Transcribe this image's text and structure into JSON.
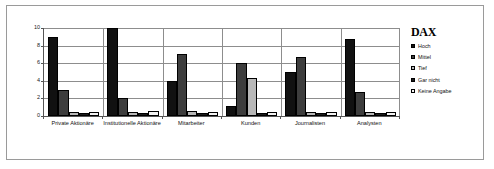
{
  "chart_data": {
    "type": "bar",
    "title": "",
    "xlabel": "",
    "ylabel": "",
    "ylim": [
      0,
      10
    ],
    "yticks": [
      0,
      2,
      4,
      6,
      8,
      10
    ],
    "grid": true,
    "legend_position": "right",
    "legend_title": "DAX",
    "categories": [
      "Private Aktionäre",
      "Institutionelle Aktionäre",
      "Mitarbeiter",
      "Kunden",
      "Journalisten",
      "Analysten"
    ],
    "series": [
      {
        "name": "Hoch",
        "color": "#111111",
        "values": [
          9.0,
          10.0,
          4.0,
          1.1,
          5.0,
          8.7
        ]
      },
      {
        "name": "Mittel",
        "color": "#3d3d3d",
        "values": [
          3.0,
          2.0,
          7.0,
          6.0,
          6.7,
          2.7
        ]
      },
      {
        "name": "Tief",
        "color": "#b8b8b8",
        "values": [
          0.4,
          0.5,
          0.6,
          4.3,
          0.4,
          0.4
        ]
      },
      {
        "name": "Gar nicht",
        "color": "#1c1c1c",
        "values": [
          0.3,
          0.3,
          0.3,
          0.3,
          0.3,
          0.3
        ]
      },
      {
        "name": "Keine Angabe",
        "color": "#f2f2f2",
        "values": [
          0.5,
          0.6,
          0.5,
          0.5,
          0.5,
          0.5
        ]
      }
    ]
  }
}
